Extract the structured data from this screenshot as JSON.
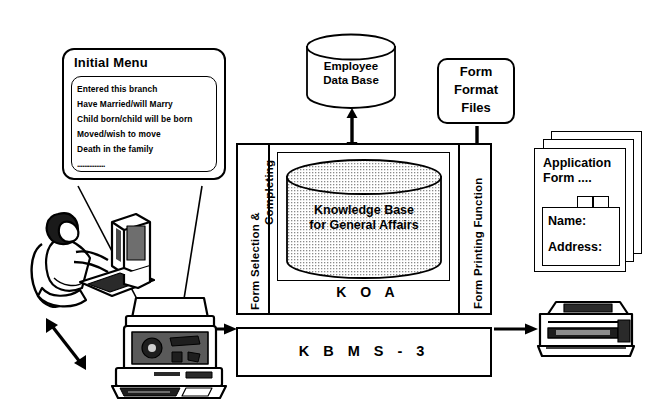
{
  "diagram": {
    "menu": {
      "title": "Initial Menu",
      "items": [
        "Entered this branch",
        "Have Married/will Marry",
        "Child born/child will be born",
        "Moved/wish to move",
        "Death in the family"
      ],
      "ellipsis": "................"
    },
    "employee_db": {
      "line1": "Employee",
      "line2": "Data Base"
    },
    "form_format_files": {
      "line1": "Form",
      "line2": "Format",
      "line3": "Files"
    },
    "knowledge_base": {
      "line1": "Knowledge Base",
      "line2": "for General Affairs"
    },
    "koa_label": "K O A",
    "kbms_label": "K B M S - 3",
    "left_function": {
      "line1": "Form Selection &",
      "line2": "Completing"
    },
    "right_function": {
      "line1": "Form Printing Function"
    },
    "application_form": {
      "line1": "Application",
      "line2": "Form ....",
      "field_name": "Name:",
      "field_address": "Address:"
    },
    "icons": {
      "operator": "person-at-terminal-icon",
      "workstation": "workstation-computer-icon",
      "printer": "printer-icon",
      "db_arrow": "bidirectional-arrow-icon",
      "format_arrow": "down-arrow-icon",
      "input_arrow": "right-arrow-icon",
      "output_arrow": "right-arrow-icon",
      "user_arrow": "bidirectional-arrow-icon"
    },
    "colors": {
      "stroke": "#000000",
      "background": "#ffffff",
      "cylinder_fill": "#d9d9d9",
      "screen_fill": "#3a3a3a"
    }
  }
}
